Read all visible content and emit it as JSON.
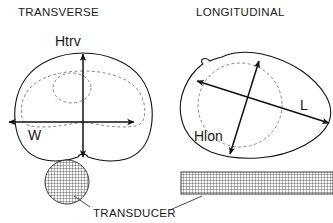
{
  "figure": {
    "background_color": "#ffffff",
    "line_color": "#111111",
    "dashed_color": "#7a7a7a"
  },
  "panels": [
    {
      "id": "transverse",
      "title": "TRANSVERSE",
      "title_x": 18,
      "title_y": 16,
      "organ_outline_note": "rounded prostate cross-section with small inferior notch",
      "inner_contour_note": "dashed inner capsule contour",
      "nucleus_note": "small dashed circle at center",
      "dimensions": [
        {
          "name": "Htrv",
          "label": "Htrv",
          "label_x": 55,
          "label_y": 46,
          "orientation": "vertical",
          "arrow": {
            "x1": 83,
            "y1": 53,
            "x2": 83,
            "y2": 157
          },
          "heads": "both"
        },
        {
          "name": "W",
          "label": "W",
          "label_x": 28,
          "label_y": 139,
          "orientation": "horizontal",
          "arrow": {
            "x1": 8,
            "y1": 122,
            "x2": 135,
            "y2": 122
          },
          "heads": "both"
        }
      ],
      "probe": {
        "shape": "circle",
        "cx": 67,
        "cy": 182,
        "r": 22,
        "hatch": "fine-grid"
      }
    },
    {
      "id": "longitudinal",
      "title": "LONGITUDINAL",
      "title_x": 196,
      "title_y": 16,
      "organ_outline_note": "irregular sagittal prostate outline with anterior notch",
      "inner_contour_note": "dashed circular inner contour",
      "dimensions": [
        {
          "name": "L",
          "label": "L",
          "label_x": 304,
          "label_y": 109,
          "orientation": "oblique-descending",
          "arrow": {
            "x1": 196,
            "y1": 81,
            "x2": 330,
            "y2": 123
          },
          "heads": "both"
        },
        {
          "name": "Hlon",
          "label": "Hlon",
          "label_x": 196,
          "label_y": 140,
          "orientation": "oblique-ascending",
          "arrow": {
            "x1": 259,
            "y1": 60,
            "x2": 230,
            "y2": 155
          },
          "heads": "both"
        }
      ],
      "probe": {
        "shape": "rectangle",
        "x": 181,
        "y": 172,
        "width": 152,
        "height": 22,
        "hatch": "fine-grid"
      }
    }
  ],
  "footer": {
    "label": "TRANSDUCER",
    "label_x": 93,
    "label_y": 217,
    "leader_to_circle": {
      "x1": 90,
      "y1": 206,
      "x2": 74,
      "y2": 195
    },
    "leader_to_rect": {
      "x1": 170,
      "y1": 209,
      "x2": 202,
      "y2": 195
    }
  }
}
